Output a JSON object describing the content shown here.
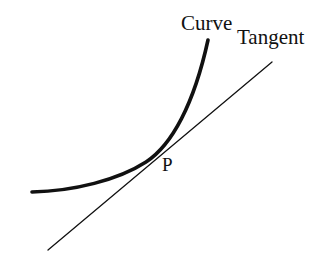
{
  "figure": {
    "kind": "geometry-diagram",
    "background_color": "#ffffff",
    "stroke_color": "#111111",
    "width": 322,
    "height": 256
  },
  "labels": {
    "curve": "Curve",
    "tangent": "Tangent",
    "point": "P"
  },
  "chart_data": {
    "type": "line",
    "xlabel": "",
    "ylabel": "",
    "grid": false,
    "legend": "none",
    "axis_visible": false,
    "xlim": [
      0,
      322
    ],
    "ylim": [
      256,
      0
    ],
    "annotations": [
      {
        "text": "Curve",
        "x": 181,
        "y": 24
      },
      {
        "text": "Tangent",
        "x": 237,
        "y": 38
      },
      {
        "text": "P",
        "x": 168,
        "y": 165
      }
    ],
    "series": [
      {
        "name": "Curve",
        "type": "curve",
        "stroke": "#111111",
        "stroke_width": 3.6,
        "path": "M 32 192 C 74 191 118 180 146 162 C 172 145 194 104 208 40",
        "points": [
          [
            32,
            192
          ],
          [
            60,
            190
          ],
          [
            90,
            185
          ],
          [
            120,
            175
          ],
          [
            146,
            162
          ],
          [
            160,
            152
          ],
          [
            172,
            138
          ],
          [
            184,
            114
          ],
          [
            196,
            78
          ],
          [
            208,
            40
          ]
        ]
      },
      {
        "name": "Tangent",
        "type": "line",
        "stroke": "#111111",
        "stroke_width": 1.3,
        "path": "M 48 250 L 272 62",
        "points": [
          [
            48,
            250
          ],
          [
            272,
            62
          ]
        ],
        "slope": -0.839,
        "touch_point": [
          168,
          146
        ]
      }
    ]
  }
}
